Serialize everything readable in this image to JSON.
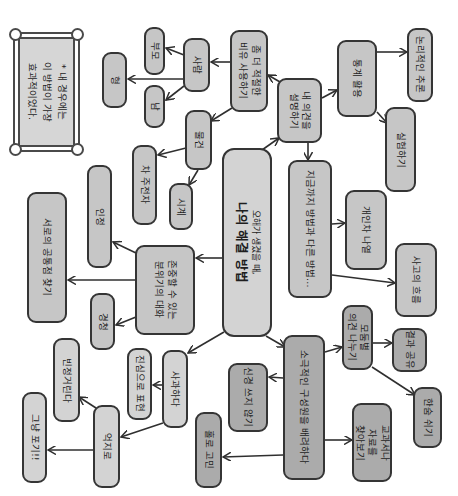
{
  "note": {
    "lines": [
      "* 내 경우에는",
      "이 방법이 가장",
      "효과적이었다."
    ]
  },
  "center": {
    "lines": [
      "오해가 생겼을 때,",
      "나의 해결 방법"
    ]
  },
  "nodes": {
    "explain_opinion": {
      "lines": [
        "내 의견을",
        "설명하기"
      ]
    },
    "analogy": {
      "lines": [
        "좀 더 적절한",
        "비유 사용하기"
      ]
    },
    "people": {
      "lines": [
        "사람"
      ]
    },
    "parents": {
      "lines": [
        "부모"
      ]
    },
    "brother": {
      "lines": [
        "형"
      ]
    },
    "others": {
      "lines": [
        "남"
      ]
    },
    "objects": {
      "lines": [
        "물건"
      ]
    },
    "teapot": {
      "lines": [
        "차 주전자"
      ]
    },
    "clock": {
      "lines": [
        "시계"
      ]
    },
    "statistics": {
      "lines": [
        "통계 활용"
      ]
    },
    "logical_reasoning": {
      "lines": [
        "논리적인 추론"
      ]
    },
    "experiment": {
      "lines": [
        "실험하기"
      ]
    },
    "different_method": {
      "lines": [
        "지금까지 방법과 다른 방법…"
      ]
    },
    "individual_diff": {
      "lines": [
        "개인차 나열"
      ]
    },
    "flow_of_thought": {
      "lines": [
        "사고의 흐름"
      ]
    },
    "respectful_talk": {
      "lines": [
        "존중할 수 있는",
        "분위기의 대화"
      ]
    },
    "acknowledge": {
      "lines": [
        "인정"
      ]
    },
    "common_ground": {
      "lines": [
        "서로의 공통점 찾기"
      ]
    },
    "listening": {
      "lines": [
        "경청"
      ]
    },
    "apologize": {
      "lines": [
        "사과하다"
      ]
    },
    "sincerely": {
      "lines": [
        "진심으로 표현"
      ]
    },
    "forced": {
      "lines": [
        "억지로"
      ]
    },
    "sarcastic": {
      "lines": [
        "빈정거린다"
      ]
    },
    "give_up": {
      "lines": [
        "그냥 포기!!"
      ]
    },
    "passive_members": {
      "lines": [
        "소극적인 구성원을 배려하다"
      ]
    },
    "ignore": {
      "lines": [
        "신경 쓰지 않기"
      ]
    },
    "worry_alone": {
      "lines": [
        "홀로 고민"
      ]
    },
    "group_discussion": {
      "lines": [
        "모둠별",
        "의견 나누기"
      ]
    },
    "share_results": {
      "lines": [
        "결과 공유"
      ]
    },
    "take_breath": {
      "lines": [
        "한숨 쉬기"
      ]
    },
    "find_materials": {
      "lines": [
        "교과서나",
        "자료를",
        "찾아보기"
      ]
    }
  },
  "edges": [
    [
      "center",
      "explain_opinion"
    ],
    [
      "explain_opinion",
      "analogy"
    ],
    [
      "analogy",
      "people"
    ],
    [
      "analogy",
      "objects"
    ],
    [
      "people",
      "parents"
    ],
    [
      "people",
      "brother"
    ],
    [
      "people",
      "others"
    ],
    [
      "objects",
      "teapot"
    ],
    [
      "objects",
      "clock"
    ],
    [
      "explain_opinion",
      "statistics"
    ],
    [
      "explain_opinion",
      "different_method"
    ],
    [
      "statistics",
      "logical_reasoning"
    ],
    [
      "statistics",
      "experiment"
    ],
    [
      "different_method",
      "individual_diff"
    ],
    [
      "different_method",
      "flow_of_thought"
    ],
    [
      "center",
      "respectful_talk"
    ],
    [
      "respectful_talk",
      "acknowledge"
    ],
    [
      "respectful_talk",
      "common_ground"
    ],
    [
      "respectful_talk",
      "listening"
    ],
    [
      "center",
      "apologize"
    ],
    [
      "apologize",
      "sincerely"
    ],
    [
      "apologize",
      "forced"
    ],
    [
      "forced",
      "sarcastic"
    ],
    [
      "forced",
      "give_up"
    ],
    [
      "center",
      "passive_members"
    ],
    [
      "passive_members",
      "ignore"
    ],
    [
      "passive_members",
      "worry_alone"
    ],
    [
      "passive_members",
      "group_discussion"
    ],
    [
      "passive_members",
      "find_materials"
    ],
    [
      "group_discussion",
      "share_results"
    ],
    [
      "group_discussion",
      "take_breath"
    ]
  ],
  "colors": {
    "node_fill": "#c6c6c6",
    "node_fill_light": "#d3d3d3",
    "node_fill_dark": "#ababab",
    "stroke": "#353535"
  }
}
